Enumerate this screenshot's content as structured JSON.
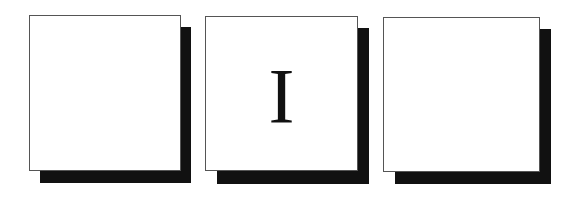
{
  "cards": [
    {
      "label": ""
    },
    {
      "label": "I"
    },
    {
      "label": ""
    }
  ],
  "colors": {
    "shadow": "#111111",
    "face": "#ffffff",
    "border": "#555555"
  }
}
